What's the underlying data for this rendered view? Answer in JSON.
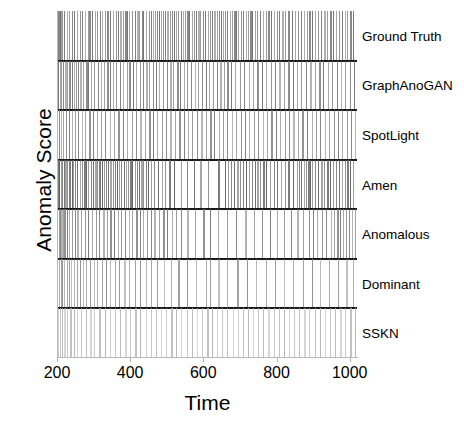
{
  "chart_data": {
    "type": "raster",
    "title": "",
    "xlabel": "Time",
    "ylabel": "Anomaly Score",
    "xlim": [
      200,
      1020
    ],
    "xticks": [
      200,
      400,
      600,
      800,
      1000
    ],
    "xticklabels": [
      "200",
      "400",
      "600",
      "800",
      "1000"
    ],
    "yticks": [],
    "yticklabels": [],
    "grid": false,
    "legend": "right-side row labels",
    "note": "Seven stacked raster sub-panels of anomaly-score spike trains; each row is one detector. Vertical line = detected anomaly at that time index. Panels separated by solid dark horizontal rules.",
    "series": [
      {
        "name": "Ground Truth",
        "color": "#6e6e6e",
        "values": [
          202,
          204,
          206,
          208,
          211,
          214,
          218,
          226,
          233,
          240,
          247,
          255,
          262,
          268,
          276,
          284,
          288,
          296,
          303,
          310,
          318,
          322,
          330,
          338,
          346,
          352,
          360,
          366,
          372,
          380,
          386,
          392,
          398,
          404,
          412,
          420,
          424,
          432,
          436,
          444,
          452,
          456,
          462,
          468,
          472,
          478,
          484,
          490,
          496,
          502,
          508,
          514,
          520,
          526,
          532,
          538,
          544,
          550,
          556,
          562,
          568,
          574,
          580,
          586,
          592,
          598,
          604,
          612,
          618,
          624,
          630,
          636,
          642,
          648,
          654,
          660,
          666,
          672,
          678,
          684,
          690,
          696,
          702,
          708,
          716,
          722,
          728,
          734,
          740,
          748,
          754,
          762,
          770,
          778,
          786,
          792,
          800,
          808,
          816,
          824,
          832,
          842,
          850,
          858,
          866,
          874,
          882,
          890,
          898,
          906,
          914,
          922,
          930,
          938,
          946,
          954,
          962,
          970,
          978,
          986,
          994,
          1002,
          1010
        ]
      },
      {
        "name": "GraphAnoGAN",
        "color": "#747474",
        "values": [
          204,
          208,
          212,
          216,
          222,
          228,
          234,
          240,
          246,
          252,
          258,
          264,
          272,
          280,
          286,
          294,
          302,
          312,
          320,
          328,
          338,
          346,
          354,
          362,
          372,
          380,
          390,
          398,
          408,
          416,
          426,
          434,
          444,
          452,
          462,
          470,
          480,
          490,
          500,
          510,
          518,
          528,
          536,
          546,
          556,
          566,
          576,
          586,
          596,
          606,
          616,
          626,
          636,
          646,
          656,
          666,
          676,
          686,
          700,
          712,
          724,
          736,
          748,
          760,
          772,
          784,
          796,
          808,
          820,
          832,
          844,
          856,
          868,
          880,
          892,
          904,
          916,
          928,
          940,
          952,
          964,
          976,
          988,
          1000,
          1012
        ]
      },
      {
        "name": "SpotLight",
        "color": "#7a7a7a",
        "values": [
          206,
          210,
          216,
          224,
          232,
          240,
          248,
          258,
          268,
          276,
          288,
          298,
          310,
          320,
          332,
          344,
          356,
          368,
          380,
          392,
          404,
          416,
          428,
          440,
          452,
          462,
          474,
          486,
          498,
          510,
          522,
          534,
          546,
          558,
          570,
          582,
          594,
          606,
          618,
          630,
          642,
          654,
          666,
          678,
          690,
          702,
          714,
          726,
          738,
          750,
          762,
          774,
          786,
          798,
          810,
          822,
          834,
          846,
          858,
          870,
          884,
          896,
          908,
          920,
          932,
          944,
          956,
          968,
          980,
          992,
          1004,
          1014
        ]
      },
      {
        "name": "Amen",
        "color": "#5f5f5f",
        "values": [
          203,
          206,
          210,
          214,
          218,
          222,
          228,
          234,
          240,
          244,
          250,
          256,
          262,
          268,
          274,
          280,
          286,
          292,
          298,
          304,
          310,
          316,
          322,
          328,
          334,
          340,
          346,
          352,
          358,
          364,
          370,
          376,
          382,
          388,
          394,
          400,
          406,
          412,
          418,
          424,
          430,
          436,
          442,
          450,
          458,
          466,
          476,
          486,
          496,
          506,
          520,
          538,
          556,
          574,
          592,
          614,
          640,
          660,
          668,
          676,
          684,
          692,
          700,
          708,
          716,
          724,
          732,
          740,
          748,
          756,
          764,
          772,
          782,
          792,
          802,
          812,
          822,
          832,
          844,
          856,
          862,
          868,
          874,
          880,
          886,
          892,
          898,
          906,
          914,
          922,
          930,
          938,
          946,
          954,
          962,
          970,
          978,
          986,
          994,
          1002,
          1010
        ]
      },
      {
        "name": "Anomalous",
        "color": "#777777",
        "values": [
          205,
          208,
          212,
          216,
          220,
          226,
          232,
          240,
          248,
          256,
          266,
          276,
          286,
          296,
          306,
          316,
          326,
          336,
          346,
          356,
          366,
          376,
          386,
          396,
          406,
          416,
          426,
          436,
          446,
          456,
          466,
          478,
          490,
          502,
          514,
          526,
          538,
          556,
          576,
          600,
          618,
          640,
          666,
          690,
          714,
          738,
          760,
          782,
          800,
          820,
          840,
          856,
          872,
          888,
          900,
          912,
          924,
          936,
          948,
          958,
          966,
          974,
          982,
          990,
          998,
          1006,
          1014
        ]
      },
      {
        "name": "Dominant",
        "color": "#8c8c8c",
        "values": [
          206,
          210,
          215,
          220,
          226,
          232,
          238,
          246,
          254,
          262,
          270,
          280,
          290,
          300,
          310,
          322,
          334,
          346,
          358,
          370,
          384,
          398,
          412,
          426,
          442,
          458,
          474,
          492,
          512,
          532,
          556,
          580,
          606,
          618,
          640,
          666,
          692,
          718,
          744,
          770,
          796,
          820,
          846,
          872,
          898,
          920,
          944,
          968,
          990,
          1010
        ]
      },
      {
        "name": "SSKN",
        "color": "#b4b4b4",
        "values": [
          204,
          208,
          214,
          220,
          228,
          236,
          246,
          256,
          266,
          278,
          290,
          302,
          316,
          330,
          344,
          358,
          372,
          386,
          400,
          414,
          428,
          442,
          456,
          470,
          484,
          498,
          512,
          526,
          540,
          554,
          568,
          582,
          596,
          610,
          624,
          638,
          652,
          666,
          680,
          694,
          708,
          722,
          736,
          750,
          764,
          778,
          792,
          806,
          820,
          834,
          848,
          862,
          876,
          890,
          904,
          918,
          932,
          946,
          960,
          974,
          988,
          1002,
          1014
        ]
      }
    ],
    "panel_order": [
      "Ground Truth",
      "GraphAnoGAN",
      "SpotLight",
      "Amen",
      "Anomalous",
      "Dominant",
      "SSKN"
    ],
    "divider_color": "#1a1a1a",
    "background": "#ffffff"
  },
  "axes": {
    "ylabel": "Anomaly Score",
    "xlabel": "Time",
    "xticklabels": [
      "200",
      "400",
      "600",
      "800",
      "1000"
    ]
  },
  "row_labels": [
    "Ground Truth",
    "GraphAnoGAN",
    "SpotLight",
    "Amen",
    "Anomalous",
    "Dominant",
    "SSKN"
  ]
}
